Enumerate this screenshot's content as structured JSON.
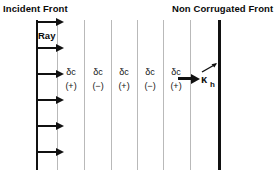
{
  "figure": {
    "background_color": "#ffffff",
    "ink_color": "#111111",
    "separator_color": "#b9b9b9"
  },
  "labels": {
    "incident_front": "Incident Front",
    "non_corrugated_front": "Non Corrugated Front",
    "ray": "Ray"
  },
  "rays": {
    "count": 6,
    "positions_y": [
      18,
      44,
      70,
      96,
      122,
      148
    ]
  },
  "separators": {
    "count": 6,
    "positions_x": [
      57,
      84,
      111,
      137,
      163,
      190
    ]
  },
  "lamellae": [
    {
      "symbol": "δc",
      "sign": "(+)",
      "x": 58
    },
    {
      "symbol": "δc",
      "sign": "(−)",
      "x": 85
    },
    {
      "symbol": "δc",
      "sign": "(+)",
      "x": 111
    },
    {
      "symbol": "δc",
      "sign": "(−)",
      "x": 137
    },
    {
      "symbol": "δc",
      "sign": "(+)",
      "x": 163
    }
  ],
  "wavevector": {
    "symbol": "κ",
    "subscript": "h",
    "arrow_label": "propagation-arrow"
  }
}
